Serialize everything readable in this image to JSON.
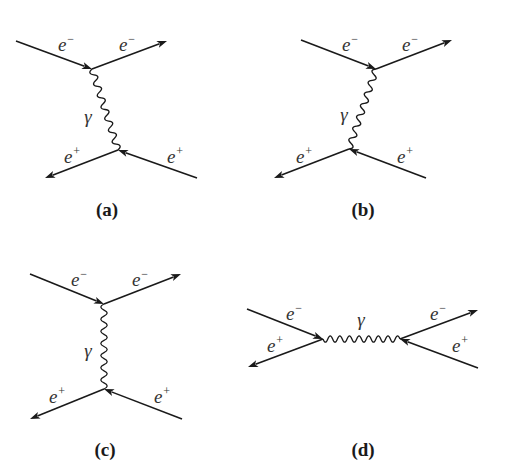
{
  "figure": {
    "stroke_color": "#1a1a1a",
    "label_color": "#333333"
  },
  "diagrams": [
    {
      "id": "a",
      "caption": "(a)",
      "caption_pos": [
        107,
        210
      ],
      "vertices": [
        [
          92,
          69
        ],
        [
          118,
          150
        ]
      ],
      "fermion_lines": [
        {
          "from": [
            16,
            41
          ],
          "to": [
            92,
            69
          ],
          "arrow": "end",
          "label": "e",
          "charge": "−",
          "label_pos": [
            66,
            44
          ]
        },
        {
          "from": [
            92,
            69
          ],
          "to": [
            167,
            41
          ],
          "arrow": "end",
          "label": "e",
          "charge": "−",
          "label_pos": [
            127,
            44
          ]
        },
        {
          "from": [
            118,
            150
          ],
          "to": [
            45,
            178
          ],
          "arrow": "end",
          "label": "e",
          "charge": "+",
          "label_pos": [
            72,
            156
          ]
        },
        {
          "from": [
            197,
            178
          ],
          "to": [
            118,
            150
          ],
          "arrow": "end",
          "label": "e",
          "charge": "+",
          "label_pos": [
            175,
            156
          ]
        }
      ],
      "photon": {
        "from": [
          92,
          69
        ],
        "to": [
          118,
          150
        ],
        "label": "γ",
        "label_pos": [
          88,
          116
        ],
        "waves": 7
      }
    },
    {
      "id": "b",
      "caption": "(b)",
      "caption_pos": [
        363,
        210
      ],
      "vertices": [
        [
          376,
          69
        ],
        [
          349,
          149
        ]
      ],
      "fermion_lines": [
        {
          "from": [
            301,
            40
          ],
          "to": [
            376,
            69
          ],
          "arrow": "end",
          "label": "e",
          "charge": "−",
          "label_pos": [
            350,
            44
          ]
        },
        {
          "from": [
            376,
            69
          ],
          "to": [
            452,
            40
          ],
          "arrow": "end",
          "label": "e",
          "charge": "−",
          "label_pos": [
            410,
            44
          ]
        },
        {
          "from": [
            349,
            149
          ],
          "to": [
            274,
            178
          ],
          "arrow": "end",
          "label": "e",
          "charge": "+",
          "label_pos": [
            304,
            156
          ]
        },
        {
          "from": [
            426,
            178
          ],
          "to": [
            349,
            149
          ],
          "arrow": "end",
          "label": "e",
          "charge": "+",
          "label_pos": [
            405,
            156
          ]
        }
      ],
      "photon": {
        "from": [
          376,
          69
        ],
        "to": [
          349,
          149
        ],
        "label": "γ",
        "label_pos": [
          344,
          114
        ],
        "waves": 7
      }
    },
    {
      "id": "c",
      "caption": "(c)",
      "caption_pos": [
        105,
        450
      ],
      "vertices": [
        [
          104,
          304
        ],
        [
          104,
          389
        ]
      ],
      "fermion_lines": [
        {
          "from": [
            30,
            274
          ],
          "to": [
            104,
            304
          ],
          "arrow": "end",
          "label": "e",
          "charge": "−",
          "label_pos": [
            79,
            279
          ]
        },
        {
          "from": [
            104,
            304
          ],
          "to": [
            181,
            274
          ],
          "arrow": "end",
          "label": "e",
          "charge": "−",
          "label_pos": [
            140,
            279
          ]
        },
        {
          "from": [
            104,
            389
          ],
          "to": [
            30,
            419
          ],
          "arrow": "end",
          "label": "e",
          "charge": "+",
          "label_pos": [
            57,
            396
          ]
        },
        {
          "from": [
            182,
            419
          ],
          "to": [
            104,
            389
          ],
          "arrow": "end",
          "label": "e",
          "charge": "+",
          "label_pos": [
            162,
            396
          ]
        }
      ],
      "photon": {
        "from": [
          104,
          304
        ],
        "to": [
          104,
          389
        ],
        "label": "γ",
        "label_pos": [
          88,
          350
        ],
        "waves": 7
      }
    },
    {
      "id": "d",
      "caption": "(d)",
      "caption_pos": [
        363,
        450
      ],
      "vertices": [
        [
          323,
          339
        ],
        [
          400,
          339
        ]
      ],
      "fermion_lines": [
        {
          "from": [
            247,
            309
          ],
          "to": [
            323,
            339
          ],
          "arrow": "end",
          "label": "e",
          "charge": "−",
          "label_pos": [
            294,
            313
          ]
        },
        {
          "from": [
            323,
            339
          ],
          "to": [
            248,
            367
          ],
          "arrow": "end",
          "label": "e",
          "charge": "+",
          "label_pos": [
            275,
            345
          ]
        },
        {
          "from": [
            400,
            339
          ],
          "to": [
            478,
            310
          ],
          "arrow": "end",
          "label": "e",
          "charge": "−",
          "label_pos": [
            438,
            313
          ]
        },
        {
          "from": [
            478,
            368
          ],
          "to": [
            400,
            339
          ],
          "arrow": "end",
          "label": "e",
          "charge": "+",
          "label_pos": [
            460,
            345
          ]
        }
      ],
      "photon": {
        "from": [
          323,
          339
        ],
        "to": [
          400,
          339
        ],
        "label": "γ",
        "label_pos": [
          361,
          319
        ],
        "waves": 8
      }
    }
  ]
}
